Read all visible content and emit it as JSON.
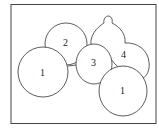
{
  "diagram": {
    "labels": [
      {
        "id": "region-1-left",
        "text": "1"
      },
      {
        "id": "region-2",
        "text": "2"
      },
      {
        "id": "region-3",
        "text": "3"
      },
      {
        "id": "region-4",
        "text": "4"
      },
      {
        "id": "region-1-right",
        "text": "1"
      }
    ],
    "stroke_color": "#333333",
    "background": "#ffffff"
  }
}
